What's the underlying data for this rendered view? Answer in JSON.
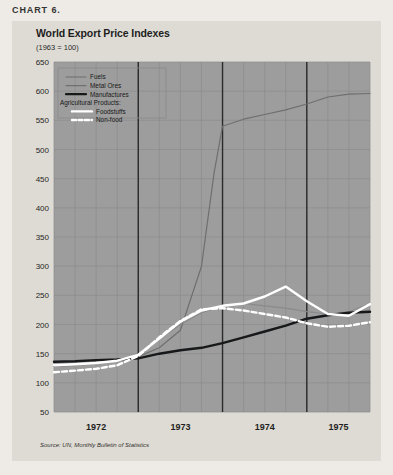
{
  "chart_label": "CHART 6.",
  "figure": {
    "title": "World Export Price Indexes",
    "subtitle": "(1963 = 100)",
    "source": "Source: UN, Monthly Bulletin of Statistics"
  },
  "legend": {
    "group_label": "Agricultural Products:",
    "items": [
      {
        "label": "Fuels",
        "style": "thin-gray",
        "color": "#6f6f6f"
      },
      {
        "label": "Metal Ores",
        "style": "thin-gray",
        "color": "#6f6f6f"
      },
      {
        "label": "Manufactures",
        "style": "thick-black",
        "color": "#17181a"
      },
      {
        "label": "Foodstuffs",
        "style": "thick-white",
        "color": "#ffffff"
      },
      {
        "label": "Non-food",
        "style": "dashed-white",
        "color": "#ffffff"
      }
    ]
  },
  "chart_data": {
    "type": "line",
    "title": "World Export Price Indexes",
    "subtitle": "(1963 = 100)",
    "xlabel": "",
    "ylabel": "",
    "ylim": [
      50,
      650
    ],
    "ytick_step": 50,
    "yticks": [
      650,
      600,
      550,
      500,
      450,
      400,
      350,
      300,
      250,
      200,
      150,
      100,
      50
    ],
    "xlim": [
      1972.0,
      1975.75
    ],
    "xticks": [
      1972,
      1973,
      1974,
      1975
    ],
    "xtick_labels": [
      "1972",
      "1973",
      "1974",
      "1975"
    ],
    "year_boundaries": [
      1973.0,
      1974.0,
      1975.0
    ],
    "grid": "quarterly vertical, 50-unit horizontal",
    "legend_position": "upper-left inside plot",
    "series": [
      {
        "name": "Fuels",
        "color": "#6f6f6f",
        "style": "solid-thin",
        "x": [
          1972.0,
          1972.25,
          1972.5,
          1972.75,
          1973.0,
          1973.25,
          1973.5,
          1973.75,
          1973.9,
          1974.0,
          1974.25,
          1974.5,
          1974.75,
          1975.0,
          1975.25,
          1975.5,
          1975.75
        ],
        "y": [
          128,
          131,
          134,
          138,
          145,
          160,
          190,
          300,
          460,
          540,
          552,
          560,
          568,
          578,
          590,
          595,
          596
        ]
      },
      {
        "name": "Metal Ores",
        "color": "#8a8a8a",
        "style": "solid-thin",
        "x": [
          1972.0,
          1972.25,
          1972.5,
          1972.75,
          1973.0,
          1973.25,
          1973.5,
          1973.75,
          1974.0,
          1974.25,
          1974.5,
          1974.75,
          1975.0,
          1975.25,
          1975.5,
          1975.75
        ],
        "y": [
          128,
          130,
          133,
          138,
          148,
          175,
          200,
          220,
          232,
          236,
          232,
          228,
          222,
          218,
          222,
          236
        ]
      },
      {
        "name": "Manufactures",
        "color": "#17181a",
        "style": "solid-thick",
        "x": [
          1972.0,
          1972.25,
          1972.5,
          1972.75,
          1973.0,
          1973.25,
          1973.5,
          1973.75,
          1974.0,
          1974.25,
          1974.5,
          1974.75,
          1975.0,
          1975.25,
          1975.5,
          1975.75
        ],
        "y": [
          136,
          137,
          139,
          140,
          142,
          150,
          156,
          160,
          168,
          178,
          188,
          198,
          210,
          216,
          220,
          222
        ]
      },
      {
        "name": "Foodstuffs",
        "color": "#ffffff",
        "style": "solid-thick",
        "x": [
          1972.0,
          1972.25,
          1972.5,
          1972.75,
          1973.0,
          1973.25,
          1973.5,
          1973.75,
          1974.0,
          1974.25,
          1974.5,
          1974.75,
          1975.0,
          1975.25,
          1975.5,
          1975.75
        ],
        "y": [
          130,
          132,
          134,
          138,
          148,
          176,
          205,
          224,
          232,
          236,
          248,
          265,
          240,
          218,
          215,
          235
        ]
      },
      {
        "name": "Non-food",
        "color": "#ffffff",
        "style": "dashed-thick",
        "x": [
          1972.0,
          1972.25,
          1972.5,
          1972.75,
          1973.0,
          1973.25,
          1973.5,
          1973.75,
          1974.0,
          1974.25,
          1974.5,
          1974.75,
          1975.0,
          1975.25,
          1975.5,
          1975.75
        ],
        "y": [
          118,
          121,
          124,
          130,
          146,
          178,
          206,
          226,
          228,
          224,
          218,
          212,
          202,
          196,
          198,
          204
        ]
      }
    ]
  }
}
